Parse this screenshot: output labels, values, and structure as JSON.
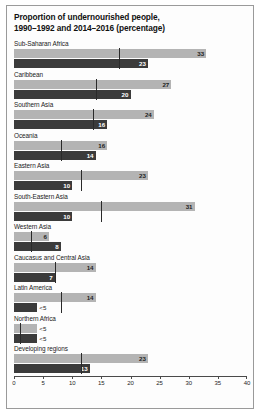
{
  "chart_data": {
    "type": "bar",
    "orientation": "horizontal",
    "title": "Proportion of undernourished people, 1990–1992 and 2014–2016 (percentage)",
    "title_lines": [
      "Proportion of undernourished people,",
      "1990–1992 and 2014–2016 (percentage)"
    ],
    "xlabel": "",
    "ylabel": "",
    "xlim": [
      0,
      40
    ],
    "xticks": [
      0,
      5,
      10,
      15,
      20,
      25,
      30,
      35,
      40
    ],
    "xticklabels": [
      "0",
      "5",
      "10",
      "15",
      "20",
      "25",
      "30",
      "35",
      "40"
    ],
    "grid": false,
    "legend": "none",
    "colors": {
      "series_1990_1992": "#b4b4b4",
      "series_2014_2016": "#3b3b3b",
      "marker_line": "#2a2a2a",
      "axis": "#4a4a4a",
      "frame": "#9a9a9a",
      "background": "#fdfdfd"
    },
    "categories": [
      "Sub-Saharan Africa",
      "Caribbean",
      "Southern Asia",
      "Oceania",
      "Eastern Asia",
      "South-Eastern Asia",
      "Western Asia",
      "Caucasus and Central Asia",
      "Latin America",
      "Northern Africa",
      "Developing regions"
    ],
    "series": [
      {
        "name": "1990–1992",
        "color": "#b4b4b4",
        "values": [
          33,
          27,
          24,
          16,
          23,
          31,
          6,
          14,
          14,
          4,
          23
        ],
        "labels": [
          "33",
          "27",
          "24",
          "16",
          "23",
          "31",
          "6",
          "14",
          "14",
          "<5",
          "23"
        ]
      },
      {
        "name": "2014–2016",
        "color": "#3b3b3b",
        "values": [
          23,
          20,
          16,
          14,
          10,
          10,
          8,
          7,
          4,
          4,
          13
        ],
        "labels": [
          "23",
          "20",
          "16",
          "14",
          "10",
          "10",
          "8",
          "7",
          "<5",
          "<5",
          "13"
        ]
      }
    ],
    "markers": [
      18,
      14,
      13.5,
      8,
      11.5,
      15,
      3,
      7,
      8,
      1,
      11.5
    ]
  }
}
